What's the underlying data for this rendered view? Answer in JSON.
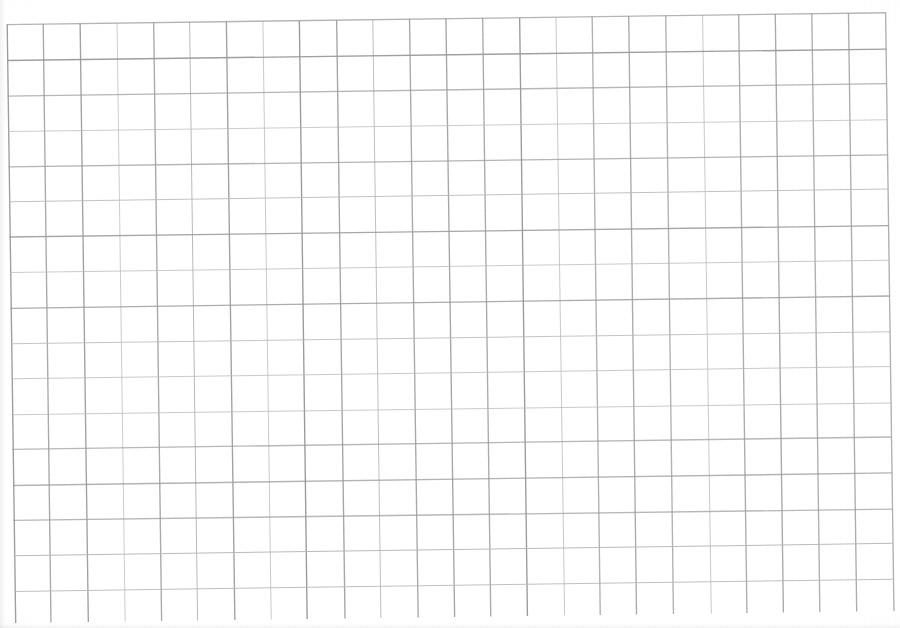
{
  "document": {
    "kind": "scanned-grid-paper",
    "title": "Blank grid paper scan",
    "caption": ""
  },
  "chart_data": {
    "type": "table",
    "title": "",
    "xlabel": "",
    "ylabel": "",
    "grid": true,
    "legend": "none",
    "columns": 24,
    "rows": 17,
    "cell_width_px": 36.6,
    "cell_height_px": 35.4,
    "categories": [],
    "values": [],
    "annotations": []
  },
  "grid": {
    "columns": 24,
    "rows": 17,
    "origin_x": 2,
    "origin_y": 8,
    "cell_width": 36.6,
    "cell_height": 35.4,
    "rotation_deg": -0.78,
    "line_color": "#9a9a9a",
    "line_color_light": "#b9b9b9",
    "line_width_major": 1.35,
    "line_width_minor": 1.0,
    "background_color": "#fefefe",
    "paper_color": "#ffffff"
  }
}
